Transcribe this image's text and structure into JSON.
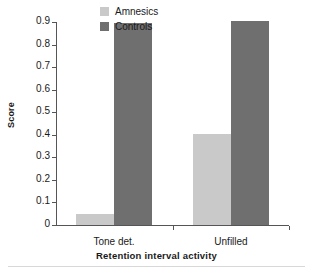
{
  "chart_data": {
    "type": "bar",
    "title": "",
    "xlabel": "Retention interval activity",
    "ylabel": "Score",
    "categories": [
      "Tone det.",
      "Unfilled"
    ],
    "series": [
      {
        "name": "Amnesics",
        "color": "#c9c9c9",
        "values": [
          0.05,
          0.405
        ]
      },
      {
        "name": "Controls",
        "color": "#6f6f6f",
        "values": [
          0.895,
          0.905
        ]
      }
    ],
    "ylim": [
      0,
      0.9
    ],
    "ytick_values": [
      0,
      0.1,
      0.2,
      0.3,
      0.4,
      0.5,
      0.6,
      0.7,
      0.8,
      0.9
    ],
    "ytick_labels": [
      "0",
      "0.1",
      "0.2",
      "0.3",
      "0.4",
      "0.5",
      "0.6",
      "0.7",
      "0.8",
      "0.9"
    ],
    "grid": false,
    "legend_position": "top-center"
  },
  "legend": {
    "items": [
      {
        "label": "Amnesics"
      },
      {
        "label": "Controls"
      }
    ]
  }
}
